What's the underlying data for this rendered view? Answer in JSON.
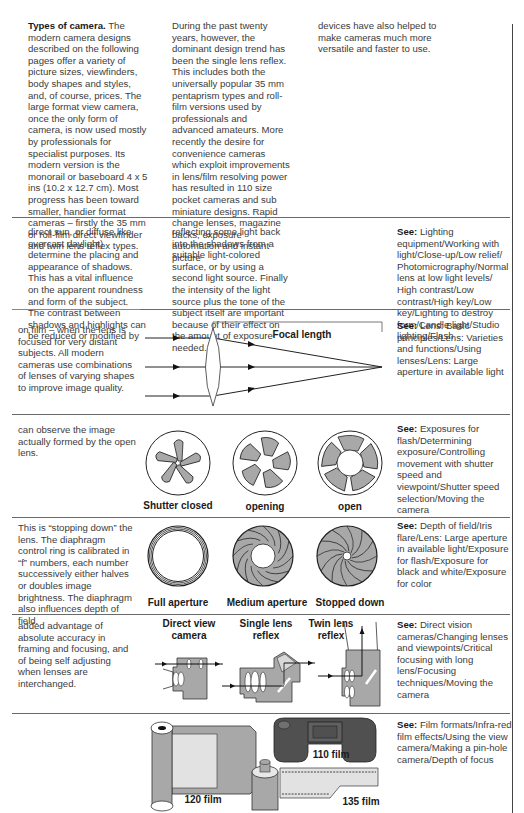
{
  "section1": {
    "heading": "Types of camera.",
    "col1": "The modern camera designs described on the following pages offer a variety of picture sizes, viewfinders, body shapes and styles, and, of course, prices. The large format view camera, once the only form of camera, is now used mostly by professionals for specialist purposes. Its modern version is the monorail or baseboard 4 x 5 ins (10.2 x 12.7 cm). Most progress has been toward smaller, handier format cameras – firstly the 35 mm or roll-film direct viewfinder and twin lens reflex types.",
    "col2": "During the past twenty years, however, the dominant design trend has been the single lens reflex. This includes both the universally popular 35 mm pentaprism types and roll-film versions used by professionals and advanced amateurs. More recently the desire for convenience cameras which exploit improvements in lens/film resolving power has resulted in 110 size pocket cameras and sub miniature designs. Rapid change lenses, magazine backs, exposure automation and instant picture",
    "col3": "devices have also helped to make cameras much more versatile and faster to use."
  },
  "section2": {
    "col1": "direct sun, or diffuse like overcast daylight) determine the placing and appearance of shadows. This has a vital influence on the apparent roundness and form of the subject. The contrast between shadows and highlights can be reduced or modified by",
    "col2": "reflecting some light back into the shadows from a suitable light-colored surface, or by using a second light source. Finally the intensity of the light source plus the tone of the subject itself are important because of their effect on the amount of exposure needed.",
    "see_label": "See:",
    "see": "Lighting equipment/Working with light/Close-up/Low relief/ Photomicrography/Normal lens at low light levels/ High contrast/Low contrast/High key/Low key/Lighting to destroy form/Candle light/Studio lighting/Flash"
  },
  "section3": {
    "text": "on film – when the lens is focused for very distant subjects. All modern cameras use combinations of lenses of varying shapes to improve image quality.",
    "diagram_label": "Focal length",
    "see_label": "See:",
    "see": "Lens: Basic principles/Lens: Varieties and functions/Using lenses/Lens: Large aperture in available light"
  },
  "section4": {
    "text": "can observe the image actually formed by the open lens.",
    "captions": [
      "Shutter closed",
      "opening",
      "open"
    ],
    "see_label": "See:",
    "see": "Exposures for flash/Determining exposure/Controlling movement with shutter speed and viewpoint/Shutter speed selection/Moving the camera"
  },
  "section5": {
    "text": "This is “stopping down” the lens. The diaphragm control ring is calibrated in “f” numbers, each number successively either halves or doubles image brightness. The diaphragm also influences depth of field.",
    "captions": [
      "Full aperture",
      "Medium aperture",
      "Stopped down"
    ],
    "see_label": "See:",
    "see": "Depth of field/Iris flare/Lens: Large aperture in available light/Exposure for flash/Exposure for black and white/Exposure for color"
  },
  "section6": {
    "text": "added advantage of absolute accuracy in framing and focusing, and of being self adjusting when lenses are interchanged.",
    "captions": [
      "Direct view camera",
      "Single lens reflex",
      "Twin lens reflex"
    ],
    "see_label": "See:",
    "see": "Direct vision cameras/Changing lenses and viewpoints/Critical focusing with long lens/Focusing techniques/Moving the camera"
  },
  "section7": {
    "captions": [
      "110 film",
      "120 film",
      "135 film"
    ],
    "see_label": "See:",
    "see": "Film formats/Infra-red film effects/Using the view camera/Making a pin-hole camera/Depth of focus"
  },
  "colors": {
    "ink": "#1a1a1a",
    "body_text": "#3c3c3c",
    "fill_gray": "#a8a8a8",
    "dark_film": "#505050",
    "light_film": "#e2e2e2"
  }
}
